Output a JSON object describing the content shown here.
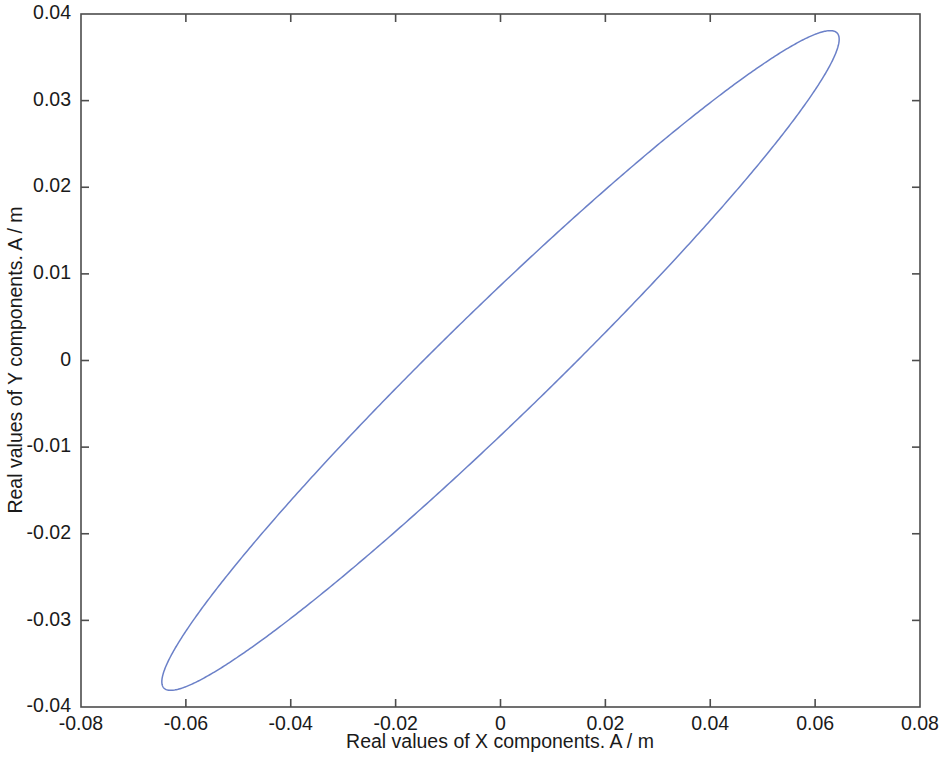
{
  "chart_data": {
    "type": "line",
    "title": "",
    "subtitle": "",
    "xlabel": "Real values of X components. A / m",
    "ylabel": "Real values of Y components. A / m",
    "xlim": [
      -0.08,
      0.08
    ],
    "ylim": [
      -0.04,
      0.04
    ],
    "xticks": [
      -0.08,
      -0.06,
      -0.04,
      -0.02,
      0,
      0.02,
      0.04,
      0.06,
      0.08
    ],
    "xticklabels": [
      "-0.08",
      "-0.06",
      "-0.04",
      "-0.02",
      "0",
      "0.02",
      "0.04",
      "0.06",
      "0.08"
    ],
    "yticks": [
      -0.04,
      -0.03,
      -0.02,
      -0.01,
      0,
      0.01,
      0.02,
      0.03,
      0.04
    ],
    "yticklabels": [
      "-0.04",
      "-0.03",
      "-0.02",
      "-0.01",
      "0",
      "0.01",
      "0.02",
      "0.03",
      "0.04"
    ],
    "grid": false,
    "legend": null,
    "legend_position": "none",
    "box": true,
    "tick_direction": "in",
    "series": [
      {
        "name": "polarization ellipse",
        "shape": "closed-ellipse",
        "color": "#6b80c8",
        "linewidth": 1.5,
        "ellipse": {
          "center_x": 0.0,
          "center_y": 0.0,
          "semi_major": 0.0746,
          "semi_minor": 0.0075,
          "tilt_degrees": 30.2
        },
        "extent": {
          "x_min": -0.0645,
          "x_max": 0.0645,
          "y_min": -0.0375,
          "y_max": 0.0375
        },
        "points": [
          [
            0.0645,
            0.0375
          ],
          [
            0.06,
            0.0368
          ],
          [
            0.05,
            0.0336
          ],
          [
            0.04,
            0.0294
          ],
          [
            0.03,
            0.0245
          ],
          [
            0.02,
            0.0192
          ],
          [
            0.01,
            0.0134
          ],
          [
            0.0,
            0.0073
          ],
          [
            -0.01,
            0.001
          ],
          [
            -0.02,
            -0.0055
          ],
          [
            -0.03,
            -0.012
          ],
          [
            -0.04,
            -0.0187
          ],
          [
            -0.05,
            -0.0254
          ],
          [
            -0.06,
            -0.033
          ],
          [
            -0.0645,
            -0.0375
          ],
          [
            -0.06,
            -0.0368
          ],
          [
            -0.05,
            -0.0336
          ],
          [
            -0.04,
            -0.0294
          ],
          [
            -0.03,
            -0.0245
          ],
          [
            -0.02,
            -0.0192
          ],
          [
            -0.01,
            -0.0134
          ],
          [
            0.0,
            -0.0073
          ],
          [
            0.01,
            -0.001
          ],
          [
            0.02,
            0.0055
          ],
          [
            0.03,
            0.012
          ],
          [
            0.04,
            0.0187
          ],
          [
            0.05,
            0.0254
          ],
          [
            0.06,
            0.033
          ],
          [
            0.0645,
            0.0375
          ]
        ]
      }
    ]
  },
  "figure": {
    "background_color": "#ffffff",
    "axis_color": "#4d4d4d",
    "text_color": "#1a1a1a"
  }
}
